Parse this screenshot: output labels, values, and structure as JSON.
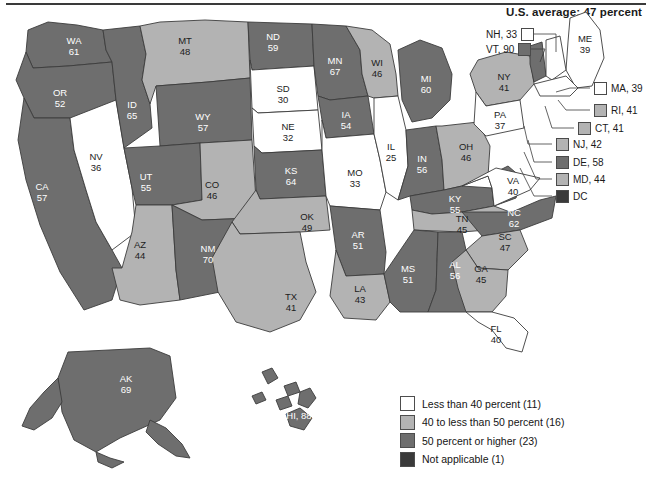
{
  "header": {
    "title": "U.S. average: 47 percent"
  },
  "colors": {
    "under40": "#ffffff",
    "mid40s": "#b3b3b3",
    "over50": "#6e6e6e",
    "not_applicable": "#3a3a3a",
    "outline": "#3c3c3c",
    "text_dark": "#1c1c1c",
    "text_light": "#ffffff"
  },
  "legend": {
    "items": [
      {
        "label": "Less than 40 percent (11)",
        "swatch": "under40",
        "count": 11
      },
      {
        "label": "40 to less than 50 percent (16)",
        "swatch": "mid40s",
        "count": 16
      },
      {
        "label": "50 percent or higher (23)",
        "swatch": "over50",
        "count": 23
      },
      {
        "label": "Not applicable (1)",
        "swatch": "not_applicable",
        "count": 1
      }
    ]
  },
  "chart_data": {
    "type": "choropleth",
    "title": "U.S. average: 47 percent",
    "unit": "percent",
    "national_average": 47,
    "bins": [
      {
        "name": "Less than 40 percent",
        "min": 0,
        "max": 39,
        "color": "#ffffff",
        "count": 11
      },
      {
        "name": "40 to less than 50 percent",
        "min": 40,
        "max": 49,
        "color": "#b3b3b3",
        "count": 16
      },
      {
        "name": "50 percent or higher",
        "min": 50,
        "max": 100,
        "color": "#6e6e6e",
        "count": 23
      },
      {
        "name": "Not applicable",
        "color": "#3a3a3a",
        "count": 1
      }
    ],
    "states": [
      {
        "code": "AL",
        "value": 56,
        "bin": "over50"
      },
      {
        "code": "AK",
        "value": 69,
        "bin": "over50"
      },
      {
        "code": "AZ",
        "value": 44,
        "bin": "mid40s"
      },
      {
        "code": "AR",
        "value": 51,
        "bin": "over50"
      },
      {
        "code": "CA",
        "value": 57,
        "bin": "over50"
      },
      {
        "code": "CO",
        "value": 46,
        "bin": "mid40s"
      },
      {
        "code": "CT",
        "value": 41,
        "bin": "mid40s"
      },
      {
        "code": "DE",
        "value": 58,
        "bin": "over50"
      },
      {
        "code": "DC",
        "value": null,
        "bin": "not_applicable"
      },
      {
        "code": "FL",
        "value": 40,
        "bin": "under40"
      },
      {
        "code": "GA",
        "value": 45,
        "bin": "mid40s"
      },
      {
        "code": "HI",
        "value": 88,
        "bin": "over50"
      },
      {
        "code": "ID",
        "value": 65,
        "bin": "over50"
      },
      {
        "code": "IL",
        "value": 25,
        "bin": "under40"
      },
      {
        "code": "IN",
        "value": 56,
        "bin": "over50"
      },
      {
        "code": "IA",
        "value": 54,
        "bin": "over50"
      },
      {
        "code": "KS",
        "value": 64,
        "bin": "over50"
      },
      {
        "code": "KY",
        "value": 55,
        "bin": "over50"
      },
      {
        "code": "LA",
        "value": 43,
        "bin": "mid40s"
      },
      {
        "code": "ME",
        "value": 39,
        "bin": "under40"
      },
      {
        "code": "MD",
        "value": 44,
        "bin": "mid40s"
      },
      {
        "code": "MA",
        "value": 39,
        "bin": "under40"
      },
      {
        "code": "MI",
        "value": 60,
        "bin": "over50"
      },
      {
        "code": "MN",
        "value": 67,
        "bin": "over50"
      },
      {
        "code": "MS",
        "value": 51,
        "bin": "over50"
      },
      {
        "code": "MO",
        "value": 33,
        "bin": "under40"
      },
      {
        "code": "MT",
        "value": 48,
        "bin": "mid40s"
      },
      {
        "code": "NE",
        "value": 32,
        "bin": "under40"
      },
      {
        "code": "NV",
        "value": 36,
        "bin": "under40"
      },
      {
        "code": "NH",
        "value": 33,
        "bin": "under40"
      },
      {
        "code": "NJ",
        "value": 42,
        "bin": "mid40s"
      },
      {
        "code": "NM",
        "value": 70,
        "bin": "over50"
      },
      {
        "code": "NY",
        "value": 41,
        "bin": "mid40s"
      },
      {
        "code": "NC",
        "value": 62,
        "bin": "over50"
      },
      {
        "code": "ND",
        "value": 59,
        "bin": "over50"
      },
      {
        "code": "OH",
        "value": 46,
        "bin": "mid40s"
      },
      {
        "code": "OK",
        "value": 49,
        "bin": "mid40s"
      },
      {
        "code": "OR",
        "value": 52,
        "bin": "over50"
      },
      {
        "code": "PA",
        "value": 37,
        "bin": "under40"
      },
      {
        "code": "RI",
        "value": 41,
        "bin": "mid40s"
      },
      {
        "code": "SC",
        "value": 47,
        "bin": "mid40s"
      },
      {
        "code": "SD",
        "value": 30,
        "bin": "under40"
      },
      {
        "code": "TN",
        "value": 45,
        "bin": "mid40s"
      },
      {
        "code": "TX",
        "value": 41,
        "bin": "mid40s"
      },
      {
        "code": "UT",
        "value": 55,
        "bin": "over50"
      },
      {
        "code": "VT",
        "value": 90,
        "bin": "over50"
      },
      {
        "code": "VA",
        "value": 40,
        "bin": "under40"
      },
      {
        "code": "WA",
        "value": 61,
        "bin": "over50"
      },
      {
        "code": "WV",
        "value": 58,
        "bin": "over50"
      },
      {
        "code": "WI",
        "value": 46,
        "bin": "mid40s"
      },
      {
        "code": "WY",
        "value": 57,
        "bin": "over50"
      }
    ]
  },
  "map_labels": {
    "WA": "WA\n61",
    "OR": "OR\n52",
    "ID": "ID\n65",
    "MT": "MT\n48",
    "ND": "ND\n59",
    "MN": "MN\n67",
    "WI": "WI\n46",
    "MI": "MI\n60",
    "SD": "SD\n30",
    "WY": "WY\n57",
    "NE": "NE\n32",
    "IA": "IA\n54",
    "IL": "IL\n25",
    "IN": "IN\n56",
    "OH": "OH\n46",
    "NV": "NV\n36",
    "UT": "UT\n55",
    "CO": "CO\n46",
    "KS": "KS\n64",
    "MO": "MO\n33",
    "KY": "KY\n55",
    "WV": "WV\n58",
    "VA": "VA\n40",
    "CA": "CA\n57",
    "AZ": "AZ\n44",
    "NM": "NM\n70",
    "OK": "OK\n49",
    "AR": "AR\n51",
    "TN": "TN\n45",
    "NC": "NC\n62",
    "SC": "SC\n47",
    "GA": "GA\n45",
    "MS": "MS\n51",
    "AL": "AL\n56",
    "TX": "TX\n41",
    "LA": "LA\n43",
    "FL": "FL\n40",
    "NY": "NY\n41",
    "PA": "PA\n37",
    "ME": "ME\n39",
    "AK": "AK\n69",
    "HI": "HI, 88"
  },
  "callouts": [
    {
      "label": "NH, 33",
      "swatch": "under40",
      "side": "left",
      "x": 486,
      "y": 28
    },
    {
      "label": "VT, 90",
      "swatch": "over50",
      "side": "left",
      "x": 486,
      "y": 43
    },
    {
      "label": "MA, 39",
      "swatch": "under40",
      "side": "right",
      "x": 594,
      "y": 82
    },
    {
      "label": "RI, 41",
      "swatch": "mid40s",
      "side": "right",
      "x": 594,
      "y": 104
    },
    {
      "label": "CT, 41",
      "swatch": "mid40s",
      "side": "right",
      "x": 578,
      "y": 122
    },
    {
      "label": "NJ, 42",
      "swatch": "mid40s",
      "side": "right",
      "x": 556,
      "y": 138
    },
    {
      "label": "DE, 58",
      "swatch": "over50",
      "side": "right",
      "x": 556,
      "y": 156
    },
    {
      "label": "MD, 44",
      "swatch": "mid40s",
      "side": "right",
      "x": 556,
      "y": 173
    },
    {
      "label": "DC",
      "swatch": "not_applicable",
      "side": "right",
      "x": 556,
      "y": 190
    }
  ]
}
